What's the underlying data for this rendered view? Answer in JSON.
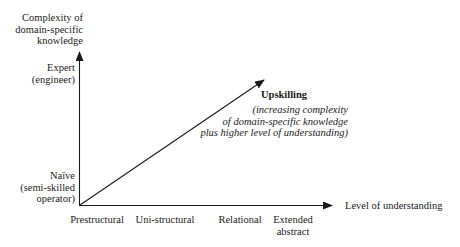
{
  "diagram": {
    "y_axis": {
      "title_lines": [
        "Complexity of",
        "domain-specific",
        "knowledge"
      ],
      "levels": [
        {
          "lines": [
            "Expert",
            "(engineer)"
          ]
        },
        {
          "lines": [
            "Naïve",
            "(semi-skilled",
            "operator)"
          ]
        }
      ]
    },
    "x_axis": {
      "title": "Level of understanding",
      "levels": [
        {
          "lines": [
            "Prestructural"
          ]
        },
        {
          "lines": [
            "Uni-structural"
          ]
        },
        {
          "lines": [
            "Relational"
          ]
        },
        {
          "lines": [
            "Extended",
            "abstract"
          ]
        }
      ]
    },
    "arrow": {
      "title": "Upskilling",
      "description_lines": [
        "(increasing complexity",
        "of domain-specific knowledge",
        "plus higher level of understanding)"
      ]
    },
    "colors": {
      "line": "#1a1a1a",
      "background": "#ffffff"
    }
  }
}
